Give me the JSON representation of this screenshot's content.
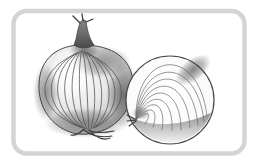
{
  "page": {
    "background": "#ffffff"
  },
  "frame": {
    "border_color": "#d4d4d4",
    "inner_fill": "#ffffff",
    "corner_radius": 13
  },
  "illustration": {
    "subject": "onion-whole-and-half",
    "style": "grayscale-line-art",
    "outline_color": "#4a4a4a",
    "skin_line_color": "#4f4f4f",
    "ring_line_color": "#6d6d6d",
    "accent_dark": "#3a3a3a",
    "body_highlight": "#fdfdfd",
    "body_edge_shade": "#979797",
    "cut_face_color": "#ffffff",
    "cut_face_edge": "#f2f2f2",
    "crescent_dark": "#8f8f8f",
    "crescent_light": "#efefef"
  }
}
